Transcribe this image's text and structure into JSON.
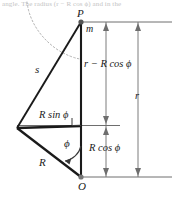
{
  "figure": {
    "caption_fragment": "angle. The radius (r − R cos ϕ) and in the",
    "labels": {
      "point_p": "P",
      "mass_m": "m",
      "side_s": "s",
      "vertical_upper": "r − R cos ϕ",
      "total_r": "r",
      "horizontal_rsin": "R sin ϕ",
      "angle_phi": "ϕ",
      "vertical_lower": "R cos ϕ",
      "radius_big_r": "R",
      "point_o": "O"
    },
    "colors": {
      "line": "#1a1a1a",
      "thin_line": "#6e6e6e",
      "dashed_curve": "#b0b0b0",
      "background": "#ffffff",
      "caption_text": "#b9b9b9"
    },
    "geometry": {
      "point_P": [
        81,
        22
      ],
      "point_O": [
        81,
        177
      ],
      "point_left_vertex": [
        17,
        128
      ],
      "right_extent": 172,
      "arrow_column_inner": 106,
      "arrow_column_outer": 138,
      "mid_line_y": 125
    }
  }
}
